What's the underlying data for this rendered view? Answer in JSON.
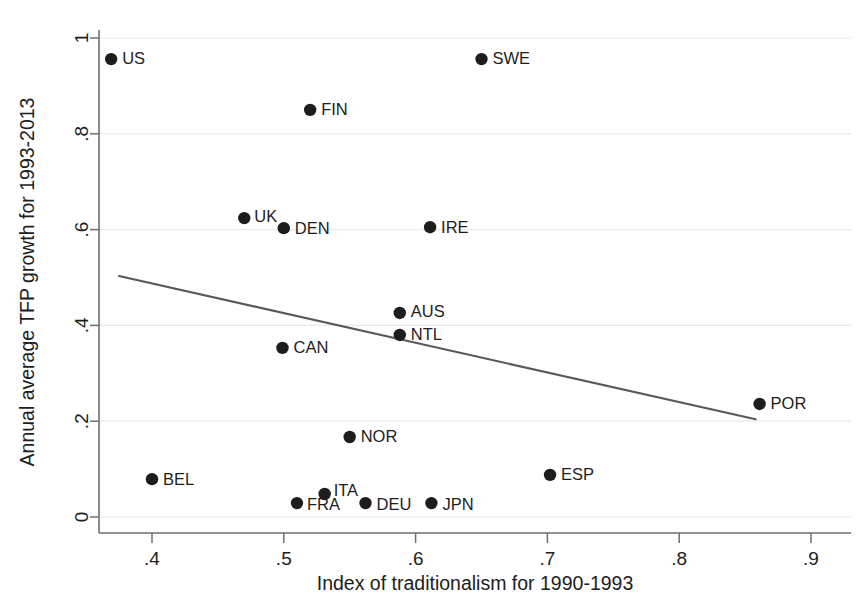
{
  "chart_data": {
    "type": "scatter",
    "title": "",
    "xlabel": "Index of traditionalism for 1990-1993",
    "ylabel": "Annual average TFP growth for 1993-2013",
    "xlim": [
      0.355,
      0.905
    ],
    "ylim": [
      0.0,
      1.04
    ],
    "xticks": [
      0.4,
      0.5,
      0.6,
      0.7,
      0.8,
      0.9
    ],
    "xticklabels": [
      ".4",
      ".5",
      ".6",
      ".7",
      ".8",
      ".9"
    ],
    "yticks": [
      0,
      0.2,
      0.4,
      0.6,
      0.8,
      1.0
    ],
    "yticklabels": [
      "0",
      ".2",
      ".4",
      ".6",
      ".8",
      "1"
    ],
    "grid": "horizontal",
    "legend": "none",
    "marker_color": "#1d1d1d",
    "line_color": "#58585a",
    "points": [
      {
        "label": "US",
        "x": 0.369,
        "y": 0.956,
        "label_dx": 11,
        "label_dy": 1
      },
      {
        "label": "SWE",
        "x": 0.65,
        "y": 0.956,
        "label_dx": 11,
        "label_dy": 1
      },
      {
        "label": "FIN",
        "x": 0.52,
        "y": 0.85,
        "label_dx": 11,
        "label_dy": 1
      },
      {
        "label": "UK",
        "x": 0.47,
        "y": 0.624,
        "label_dx": 10,
        "label_dy": 0
      },
      {
        "label": "DEN",
        "x": 0.5,
        "y": 0.603,
        "label_dx": 11,
        "label_dy": 1
      },
      {
        "label": "IRE",
        "x": 0.611,
        "y": 0.605,
        "label_dx": 11,
        "label_dy": 1
      },
      {
        "label": "AUS",
        "x": 0.588,
        "y": 0.426,
        "label_dx": 11,
        "label_dy": 0
      },
      {
        "label": "NTL",
        "x": 0.588,
        "y": 0.38,
        "label_dx": 11,
        "label_dy": 1
      },
      {
        "label": "CAN",
        "x": 0.499,
        "y": 0.353,
        "label_dx": 11,
        "label_dy": 1
      },
      {
        "label": "POR",
        "x": 0.861,
        "y": 0.236,
        "label_dx": 11,
        "label_dy": 1
      },
      {
        "label": "NOR",
        "x": 0.55,
        "y": 0.167,
        "label_dx": 11,
        "label_dy": 1
      },
      {
        "label": "ESP",
        "x": 0.702,
        "y": 0.088,
        "label_dx": 11,
        "label_dy": 1
      },
      {
        "label": "BEL",
        "x": 0.4,
        "y": 0.079,
        "label_dx": 11,
        "label_dy": 1
      },
      {
        "label": "ITA",
        "x": 0.531,
        "y": 0.048,
        "label_dx": 9,
        "label_dy": -2
      },
      {
        "label": "FRA",
        "x": 0.51,
        "y": 0.029,
        "label_dx": 10,
        "label_dy": 3
      },
      {
        "label": "DEU",
        "x": 0.562,
        "y": 0.029,
        "label_dx": 11,
        "label_dy": 3
      },
      {
        "label": "JPN",
        "x": 0.612,
        "y": 0.029,
        "label_dx": 11,
        "label_dy": 3
      }
    ],
    "fit_line": {
      "x0": 0.375,
      "y0": 0.503,
      "x1": 0.858,
      "y1": 0.204
    }
  }
}
